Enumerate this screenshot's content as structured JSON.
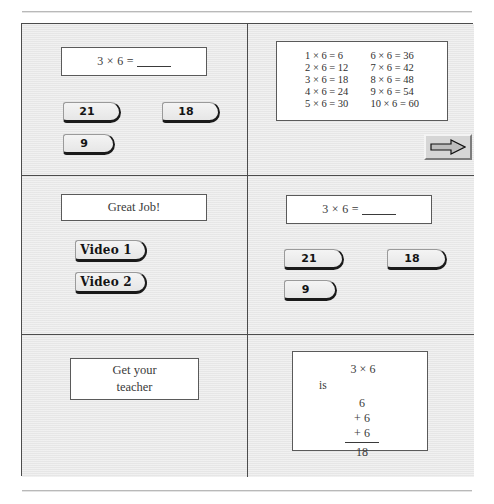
{
  "page": {
    "accent_color": "#4c4c4c",
    "cell_background": "#e9e9e9",
    "box_background": "#ffffff"
  },
  "cells": {
    "top_left": {
      "question": {
        "expression": "3 × 6 =",
        "blank": "____"
      },
      "answers": [
        {
          "label": "21"
        },
        {
          "label": "18"
        },
        {
          "label": "9"
        }
      ]
    },
    "top_right": {
      "times_table": {
        "left_column": [
          "1 × 6 = 6",
          "2 × 6 = 12",
          "3 × 6 = 18",
          "4 × 6 = 24",
          "5 × 6 = 30"
        ],
        "right_column": [
          "6 × 6 = 36",
          "7 × 6 = 42",
          "8 × 6 = 48",
          "9 × 6 = 54",
          "10 × 6 = 60"
        ]
      },
      "next_button": {
        "icon": "arrow-right-icon"
      }
    },
    "middle_left": {
      "praise": "Great Job!",
      "videos": [
        {
          "label": "Video 1"
        },
        {
          "label": "Video 2"
        }
      ]
    },
    "middle_right": {
      "question": {
        "expression": "3 × 6 =",
        "blank": "____"
      },
      "answers": [
        {
          "label": "21"
        },
        {
          "label": "18"
        },
        {
          "label": "9"
        }
      ]
    },
    "bottom_left": {
      "message_line1": "Get your",
      "message_line2": "teacher"
    },
    "bottom_right": {
      "work": {
        "expression": "3 × 6",
        "is_label": "is",
        "addends": [
          "6",
          "+ 6",
          "+ 6"
        ],
        "sum": "18"
      }
    }
  }
}
